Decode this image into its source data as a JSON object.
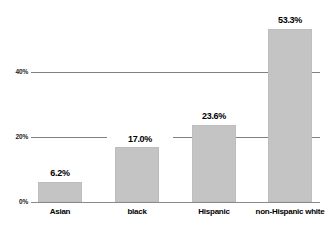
{
  "chart_data": {
    "type": "bar",
    "title": "",
    "subtitle": "",
    "xlabel": "",
    "ylabel": "",
    "categories": [
      "Asian",
      "black",
      "Hispanic",
      "non-Hispanic white"
    ],
    "values": [
      6.2,
      17.0,
      23.6,
      53.3
    ],
    "value_labels": [
      "6.2%",
      "17.0%",
      "23.6%",
      "53.3%"
    ],
    "ylim": [
      0,
      62
    ],
    "yticks": [
      0,
      20,
      40
    ],
    "ytick_labels": [
      "0%",
      "20%",
      "40%"
    ],
    "grid": true,
    "grid_axis": "y",
    "legend": false,
    "legend_position": "none",
    "bar_color": "#c4c4c4",
    "gridline_color": "#808080",
    "axis_color": "#8a8a8a",
    "text_color": "#000000",
    "background_color": "#ffffff",
    "annotations": []
  },
  "axis": {
    "y_ticks": [
      {
        "label": "40%",
        "value": 40
      },
      {
        "label": "20%",
        "value": 20
      },
      {
        "label": "0%",
        "value": 0
      }
    ]
  },
  "bars": [
    {
      "category": "Asian",
      "value": 6.2,
      "label": "6.2%",
      "on_gridline": false
    },
    {
      "category": "black",
      "value": 17.0,
      "label": "17.0%",
      "on_gridline": true
    },
    {
      "category": "Hispanic",
      "value": 23.6,
      "label": "23.6%",
      "on_gridline": false
    },
    {
      "category": "non-Hispanic white",
      "value": 53.3,
      "label": "53.3%",
      "on_gridline": false
    }
  ]
}
